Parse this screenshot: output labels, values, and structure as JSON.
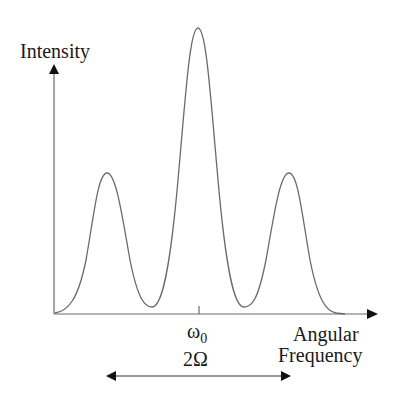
{
  "diagram": {
    "y_axis": {
      "label": "Intensity"
    },
    "x_axis": {
      "label_line1": "Angular",
      "label_line2": "Frequency"
    },
    "center_tick": {
      "label_main": "ω",
      "label_sub": "0"
    },
    "span_annotation": {
      "label": "2Ω"
    },
    "peaks": [
      {
        "name": "left-sideband",
        "x": 107,
        "y": 173
      },
      {
        "name": "central-peak",
        "x": 198,
        "y": 28
      },
      {
        "name": "right-sideband",
        "x": 289,
        "y": 173
      }
    ],
    "colors": {
      "curve": "#6a6a6a",
      "axis": "#6a6a6a",
      "text": "#1a1a1a",
      "arrowhead": "#111111"
    }
  }
}
